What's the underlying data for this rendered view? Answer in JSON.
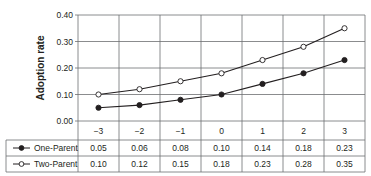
{
  "chart_data": {
    "type": "line",
    "title": "",
    "xlabel": "",
    "ylabel": "Adoption rate",
    "x": [
      -3,
      -2,
      -1,
      0,
      1,
      2,
      3
    ],
    "x_tick_labels": [
      "−3",
      "−2",
      "−1",
      "0",
      "1",
      "2",
      "3"
    ],
    "ylim": [
      0,
      0.4
    ],
    "y_ticks": [
      0.0,
      0.1,
      0.2,
      0.3,
      0.4
    ],
    "y_tick_labels": [
      "0.00",
      "0.10",
      "0.20",
      "0.30",
      "0.40"
    ],
    "grid": true,
    "legend_position": "data-table-left",
    "series": [
      {
        "name": "One-Parent",
        "marker": "filled-circle",
        "values": [
          0.05,
          0.06,
          0.08,
          0.1,
          0.14,
          0.18,
          0.23
        ],
        "value_labels": [
          "0.05",
          "0.06",
          "0.08",
          "0.10",
          "0.14",
          "0.18",
          "0.23"
        ]
      },
      {
        "name": "Two-Parent",
        "marker": "open-circle",
        "values": [
          0.1,
          0.12,
          0.15,
          0.18,
          0.23,
          0.28,
          0.35
        ],
        "value_labels": [
          "0.10",
          "0.12",
          "0.15",
          "0.18",
          "0.23",
          "0.28",
          "0.35"
        ]
      }
    ]
  },
  "colors": {
    "line": "#231f20",
    "grid": "#6d6e71",
    "background": "#ffffff"
  }
}
